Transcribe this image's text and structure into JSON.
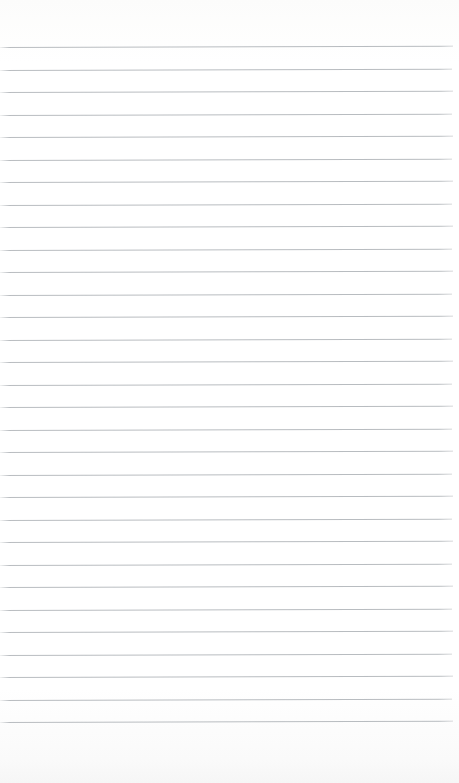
{
  "page": {
    "kind": "lined-notebook-page",
    "width": 459,
    "height": 783,
    "background_color": "#fdfdfd",
    "content_text": "",
    "has_text": false,
    "has_header": false,
    "has_page_number": false,
    "has_margin_rule": false
  },
  "ruling": {
    "line_color": "#b5b9bd",
    "line_thickness_px": 1,
    "line_count": 31,
    "first_line_y": 47,
    "last_line_y": 723,
    "line_spacing_px": 22.5,
    "line_start_x": 0,
    "line_end_x": 453,
    "slant_degrees": -0.16,
    "top_margin_px": 47,
    "bottom_margin_px": 60,
    "right_margin_px": 6,
    "line_y_positions": [
      47,
      69.5,
      92,
      114.5,
      137,
      159.5,
      182,
      204.5,
      227,
      249.5,
      272,
      294.5,
      317,
      339.5,
      362,
      384.5,
      407,
      429.5,
      452,
      474.5,
      497,
      519.5,
      542,
      564.5,
      587,
      609.5,
      632,
      654.5,
      677,
      699.5,
      722
    ],
    "line_widths": [
      453,
      452,
      453,
      452,
      453,
      452,
      453,
      452,
      453,
      452,
      453,
      452,
      453,
      452,
      453,
      452,
      453,
      452,
      453,
      452,
      453,
      452,
      453,
      452,
      453,
      452,
      453,
      452,
      453,
      452,
      453
    ]
  }
}
